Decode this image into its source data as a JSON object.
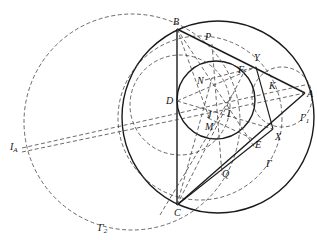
{
  "figure": {
    "type": "geometry-diagram",
    "points": {
      "A": "A",
      "B": "B",
      "C": "C",
      "D": "D",
      "E": "E",
      "F": "F",
      "I": "I",
      "J": "J",
      "K": "K",
      "M": "M",
      "N": "N",
      "P": "P",
      "Q": "Q",
      "X": "X",
      "Y": "Y"
    },
    "labels": {
      "IA_main": "I",
      "IA_sub": "A",
      "Gamma": "Γ",
      "Gamma1_main": "Γ",
      "Gamma1_sub": "1",
      "Gamma2_main": "Γ",
      "Gamma2_sub": "2"
    },
    "colors": {
      "ink": "#1a1a1a",
      "dash": "#444444",
      "background": "#ffffff"
    }
  }
}
